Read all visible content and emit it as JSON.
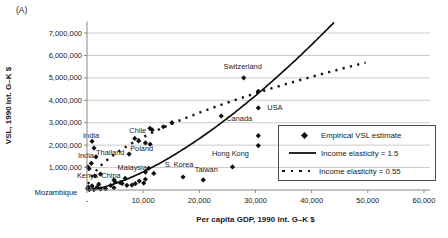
{
  "figure_label": "(A)",
  "chart_data": {
    "type": "scatter",
    "title": "",
    "xlabel": "Per capita GDP, 1990 Int. G–K $",
    "ylabel": "VSL, 1990 Int. G–K $",
    "xlim": [
      0,
      60000
    ],
    "ylim": [
      0,
      7500000
    ],
    "grid": "horizontal",
    "x_ticks": [
      {
        "value": 0,
        "label": "-"
      },
      {
        "value": 10000,
        "label": "10,000"
      },
      {
        "value": 20000,
        "label": "20,000"
      },
      {
        "value": 30000,
        "label": "30,000"
      },
      {
        "value": 40000,
        "label": "40,000"
      },
      {
        "value": 50000,
        "label": "50,000"
      },
      {
        "value": 60000,
        "label": "60,000"
      }
    ],
    "y_ticks": [
      {
        "value": 1000000,
        "label": "1,000,000"
      },
      {
        "value": 2000000,
        "label": "2,000,000"
      },
      {
        "value": 3000000,
        "label": "3,000,000"
      },
      {
        "value": 4000000,
        "label": "4,000,000"
      },
      {
        "value": 5000000,
        "label": "5,000,000"
      },
      {
        "value": 6000000,
        "label": "6,000,000"
      },
      {
        "value": 7000000,
        "label": "7,000,000"
      }
    ],
    "legend": {
      "position": "inside-right",
      "entries": [
        {
          "marker": "diamond",
          "label": "Empirical VSL estimate"
        },
        {
          "marker": "solid-line",
          "label": "Income elasticity = 1.5"
        },
        {
          "marker": "dotted-line",
          "label": "Income elasticity = 0.55"
        }
      ]
    },
    "curves": [
      {
        "name": "Income elasticity = 1.5",
        "style": "solid",
        "model": "vsl = coefficient * gdp^elasticity",
        "elasticity": 1.5,
        "coefficient": 0.81,
        "gdp_min": 0,
        "gdp_max": 44000
      },
      {
        "name": "Income elasticity = 0.55",
        "style": "dotted",
        "model": "vsl = coefficient * gdp^elasticity",
        "elasticity": 0.55,
        "coefficient": 14855,
        "gdp_min": 200,
        "gdp_max": 49600
      }
    ],
    "labeled_points": [
      {
        "label": "Mozambique",
        "gdp": 200,
        "vsl": 130000,
        "anchor": "end",
        "dx": -11,
        "dy": 8
      },
      {
        "label": "Kenya",
        "gdp": 1400,
        "vsl": 625000,
        "anchor": "end",
        "dx": 3,
        "dy": 2.5
      },
      {
        "label": "China",
        "gdp": 4800,
        "vsl": 450000,
        "anchor": "middle",
        "dx": -3,
        "dy": -1.5
      },
      {
        "label": "India",
        "gdp": 900,
        "vsl": 2170000,
        "anchor": "middle",
        "dx": -1,
        "dy": -3.5
      },
      {
        "label": "India",
        "gdp": 1600,
        "vsl": 1480000,
        "anchor": "end",
        "dx": -2,
        "dy": 1.5
      },
      {
        "label": "Thailand",
        "gdp": 1250,
        "vsl": 1870000,
        "anchor": "start",
        "dx": 2,
        "dy": 7
      },
      {
        "label": "Poland",
        "gdp": 7500,
        "vsl": 1600000,
        "anchor": "start",
        "dx": 1,
        "dy": -3.5
      },
      {
        "label": "Malaysia",
        "gdp": 11000,
        "vsl": 970000,
        "anchor": "end",
        "dx": -2,
        "dy": 2
      },
      {
        "label": "Chile",
        "gdp": 11600,
        "vsl": 2680000,
        "anchor": "end",
        "dx": -6,
        "dy": 3.5
      },
      {
        "label": "S. Korea",
        "gdp": 17100,
        "vsl": 580000,
        "anchor": "middle",
        "dx": -4,
        "dy": -10
      },
      {
        "label": "Taiwan",
        "gdp": 20700,
        "vsl": 450000,
        "anchor": "middle",
        "dx": 3,
        "dy": -8
      },
      {
        "label": "Hong Kong",
        "gdp": 25900,
        "vsl": 1030000,
        "anchor": "middle",
        "dx": -2,
        "dy": -11
      },
      {
        "label": "Canada",
        "gdp": 23900,
        "vsl": 3300000,
        "anchor": "start",
        "dx": 5,
        "dy": 5.5
      },
      {
        "label": "USA",
        "gdp": 30500,
        "vsl": 3660000,
        "anchor": "start",
        "dx": 9,
        "dy": 2
      },
      {
        "label": "Switzerland",
        "gdp": 27900,
        "vsl": 5000000,
        "anchor": "middle",
        "dx": -1,
        "dy": -9
      }
    ],
    "points": [
      [
        770,
        1190000
      ],
      [
        150,
        1030000
      ],
      [
        350,
        950000
      ],
      [
        2400,
        710000
      ],
      [
        11900,
        740000
      ],
      [
        10400,
        800000
      ],
      [
        8500,
        2300000
      ],
      [
        9200,
        2190000
      ],
      [
        10400,
        2100000
      ],
      [
        11250,
        2040000
      ],
      [
        11200,
        2750000
      ],
      [
        13600,
        2820000
      ],
      [
        15100,
        3000000
      ],
      [
        30500,
        4400000
      ],
      [
        30500,
        2420000
      ],
      [
        30500,
        1980000
      ],
      [
        100,
        60000
      ],
      [
        400,
        20000
      ],
      [
        900,
        180000
      ],
      [
        1200,
        20000
      ],
      [
        1800,
        120000
      ],
      [
        2100,
        260000
      ],
      [
        2400,
        50000
      ],
      [
        3300,
        60000
      ],
      [
        4200,
        200000
      ],
      [
        4800,
        100000
      ],
      [
        5000,
        370000
      ],
      [
        5900,
        330000
      ],
      [
        6250,
        290000
      ],
      [
        6800,
        520000
      ],
      [
        7100,
        210000
      ],
      [
        8000,
        220000
      ],
      [
        8600,
        280000
      ],
      [
        9300,
        400000
      ],
      [
        10100,
        310000
      ],
      [
        10400,
        480000
      ]
    ],
    "colors": {
      "marker": "#111111",
      "solid_line": "#111111",
      "dotted_line": "#111111",
      "gridline": "#cbcbcb",
      "axis": "#8a8a8a",
      "text": "#1a1a1a"
    }
  }
}
